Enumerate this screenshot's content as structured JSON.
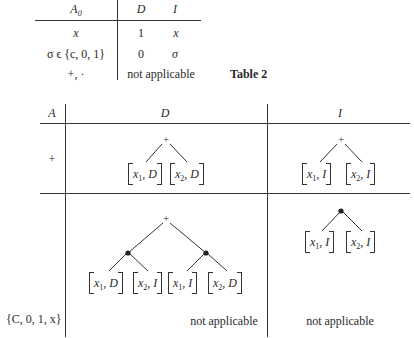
{
  "table1": {
    "headers": {
      "a0": "A",
      "a0_sub": "0",
      "d": "D",
      "i": "I"
    },
    "rows": [
      {
        "a0": "x",
        "d": "1",
        "i": "x"
      },
      {
        "a0": "σ ϵ {c, 0, 1}",
        "d": "0",
        "i": "σ"
      },
      {
        "a0": "+, ·",
        "di_merged": "not applicable"
      }
    ],
    "caption": "Table 2"
  },
  "table2": {
    "headers": {
      "a": "A",
      "d": "D",
      "i": "I"
    },
    "rows": [
      {
        "a": "+",
        "d": {
          "root": "+",
          "leaves": [
            "[x₁, D]",
            "[x₂, D]"
          ]
        },
        "i": {
          "root": "+",
          "leaves": [
            "[x₁, I]",
            "[x₂, I]"
          ]
        }
      },
      {
        "a": "·",
        "d": {
          "root": "+",
          "children": [
            {
              "node": "•",
              "leaves": [
                "[x₁, D]",
                "[x₂, I]"
              ]
            },
            {
              "node": "•",
              "leaves": [
                "[x₁, I]",
                "[x₂, D]"
              ]
            }
          ]
        },
        "i": {
          "root": "•",
          "leaves": [
            "[x₁, I]",
            "[x₂, I]"
          ]
        }
      },
      {
        "a": "{C, 0, 1, x}",
        "d": "not applicable",
        "i": "not applicable"
      }
    ]
  },
  "leaf_parts": {
    "x1": "x",
    "x2": "x",
    "s1": "1",
    "s2": "2",
    "D": "D",
    "I": "I"
  }
}
